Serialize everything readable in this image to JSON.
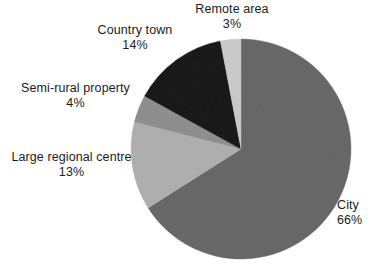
{
  "chart_data": {
    "type": "pie",
    "title": "",
    "subtitle": "",
    "xlabel": "",
    "ylabel": "",
    "legend_position": "outside-labels",
    "grid": false,
    "value_unit": "%",
    "start_angle_deg": 0,
    "direction": "clockwise",
    "categories": [
      "City",
      "Large regional centre",
      "Semi-rural property",
      "Country town",
      "Remote area"
    ],
    "values": [
      66,
      13,
      4,
      14,
      3
    ],
    "slices": [
      {
        "label": "City",
        "value": 66,
        "value_text": "66%",
        "color": "#646464",
        "label_align": "left"
      },
      {
        "label": "Large regional centre",
        "value": 13,
        "value_text": "13%",
        "color": "#adadad",
        "label_align": "center"
      },
      {
        "label": "Semi-rural property",
        "value": 4,
        "value_text": "4%",
        "color": "#8c8c8c",
        "label_align": "center"
      },
      {
        "label": "Country town",
        "value": 14,
        "value_text": "14%",
        "color": "#131313",
        "label_align": "center"
      },
      {
        "label": "Remote area",
        "value": 3,
        "value_text": "3%",
        "color": "#c9c9c9",
        "label_align": "center"
      }
    ]
  },
  "colors": {
    "background": "#ffffff",
    "text": "#1b1b1b",
    "city": "#646464",
    "large_regional_centre": "#adadad",
    "semi_rural_property": "#8c8c8c",
    "country_town": "#131313",
    "remote_area": "#c9c9c9"
  },
  "labels": {
    "remote_area": {
      "name": "Remote area",
      "value": "3%"
    },
    "country_town": {
      "name": "Country town",
      "value": "14%"
    },
    "semi_rural_property": {
      "name": "Semi-rural property",
      "value": "4%"
    },
    "large_regional_centre": {
      "name": "Large regional centre",
      "value": "13%"
    },
    "city": {
      "name": "City",
      "value": "66%"
    }
  },
  "geometry": {
    "center_x": 241,
    "center_y": 149,
    "radius": 110
  }
}
